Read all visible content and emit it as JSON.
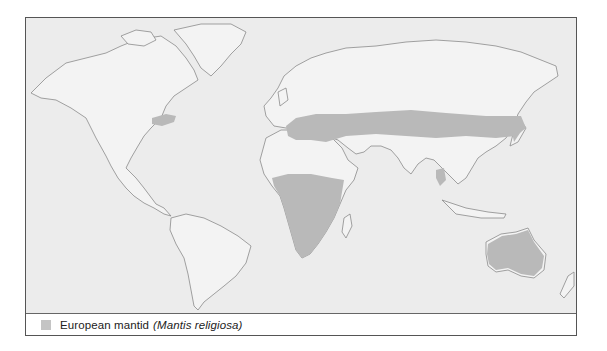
{
  "map": {
    "title": "European mantid distribution",
    "colors": {
      "ocean": "#ececec",
      "land": "#f3f3f3",
      "coastline": "#8a8a8a",
      "range": "#b9b9b9"
    },
    "range_regions": [
      "Southern Europe",
      "Central Asia band to Korea",
      "Japan",
      "Northeastern North America",
      "Sub-Saharan Africa",
      "Madagascar",
      "Indochina",
      "Australia"
    ]
  },
  "legend": {
    "swatch_color": "#c4c4c4",
    "label": "European mantid",
    "scientific_name": "(Mantis religiosa)"
  }
}
